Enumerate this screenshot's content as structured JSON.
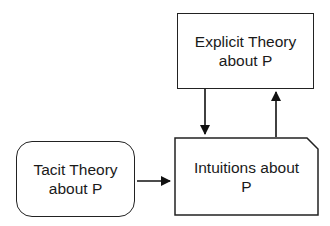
{
  "diagram": {
    "nodes": {
      "explicit": {
        "line1": "Explicit Theory",
        "line2": "about P"
      },
      "tacit": {
        "line1": "Tacit Theory",
        "line2": "about P"
      },
      "intuitions": {
        "line1": "Intuitions about",
        "line2": "P"
      }
    },
    "edges": [
      {
        "from": "tacit",
        "to": "intuitions"
      },
      {
        "from": "explicit",
        "to": "intuitions"
      },
      {
        "from": "intuitions",
        "to": "explicit"
      }
    ]
  }
}
